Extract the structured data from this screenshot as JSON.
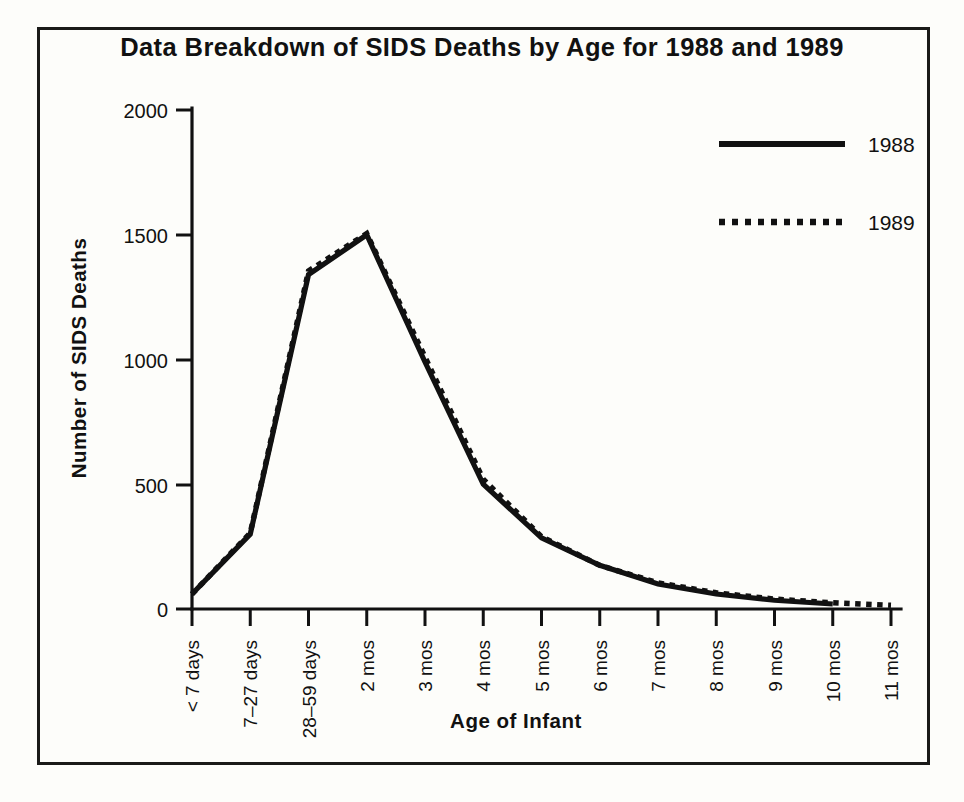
{
  "chart_data": {
    "type": "line",
    "title": "Data Breakdown of SIDS Deaths by Age for 1988 and 1989",
    "xlabel": "Age  of  Infant",
    "ylabel": "Number of SIDS Deaths",
    "categories": [
      "< 7 days",
      "7–27 days",
      "28–59 days",
      "2 mos",
      "3 mos",
      "4 mos",
      "5 mos",
      "6 mos",
      "7 mos",
      "8 mos",
      "9 mos",
      "10 mos",
      "11 mos"
    ],
    "series": [
      {
        "name": "1988",
        "style": "solid",
        "values": [
          60,
          300,
          1340,
          1500,
          990,
          500,
          285,
          175,
          100,
          60,
          35,
          20,
          null
        ]
      },
      {
        "name": "1989",
        "style": "dotted",
        "values": [
          60,
          305,
          1355,
          1505,
          1010,
          520,
          290,
          175,
          105,
          65,
          40,
          25,
          15
        ]
      }
    ],
    "yticks": [
      0,
      500,
      1000,
      1500,
      2000
    ],
    "ytick_labels": [
      "0",
      "500",
      "1000",
      "1500",
      "2000"
    ],
    "ylim": [
      0,
      2000
    ],
    "grid": false,
    "legend_position": "top-right",
    "colors": {
      "line": "#111111",
      "background": "#fdfdfa",
      "frame": "#1a1a18"
    }
  },
  "legend": {
    "items": [
      {
        "label": "1988",
        "swatch": "solid-line-swatch"
      },
      {
        "label": "1989",
        "swatch": "dotted-line-swatch"
      }
    ]
  }
}
